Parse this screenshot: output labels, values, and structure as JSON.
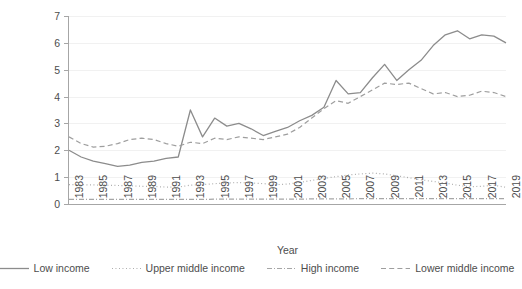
{
  "chart_data": {
    "type": "line",
    "title": "",
    "xlabel": "Year",
    "ylabel": "Remittances as share of GDP (%)",
    "xlim": [
      1983,
      2019
    ],
    "ylim": [
      0,
      7
    ],
    "ytick_labels": [
      "0",
      "1",
      "2",
      "3",
      "4",
      "5",
      "6",
      "7"
    ],
    "yticks": [
      0,
      1,
      2,
      3,
      4,
      5,
      6,
      7
    ],
    "grid": "horizontal",
    "legend_position": "bottom",
    "x": [
      1983,
      1984,
      1985,
      1986,
      1987,
      1988,
      1989,
      1990,
      1991,
      1992,
      1993,
      1994,
      1995,
      1996,
      1997,
      1998,
      1999,
      2000,
      2001,
      2002,
      2003,
      2004,
      2005,
      2006,
      2007,
      2008,
      2009,
      2010,
      2011,
      2012,
      2013,
      2014,
      2015,
      2016,
      2017,
      2018,
      2019
    ],
    "xtick_labels": [
      "1983",
      "1985",
      "1987",
      "1989",
      "1991",
      "1993",
      "1995",
      "1997",
      "1999",
      "2001",
      "2003",
      "2005",
      "2007",
      "2009",
      "2011",
      "2013",
      "2015",
      "2017",
      "2019"
    ],
    "series": [
      {
        "name": "Low income",
        "style": "solid",
        "color": "#8c8c8c",
        "values": [
          2.0,
          1.75,
          1.6,
          1.5,
          1.4,
          1.45,
          1.55,
          1.6,
          1.7,
          1.75,
          3.5,
          2.5,
          3.2,
          2.9,
          3.0,
          2.8,
          2.55,
          2.7,
          2.85,
          3.1,
          3.3,
          3.6,
          4.6,
          4.1,
          4.15,
          4.7,
          5.2,
          4.6,
          5.0,
          5.35,
          5.9,
          6.3,
          6.45,
          6.15,
          6.3,
          6.25,
          6.0
        ]
      },
      {
        "name": "Upper middle income",
        "style": "dotted",
        "color": "#a6a6a6",
        "values": [
          0.72,
          0.72,
          0.71,
          0.7,
          0.69,
          0.68,
          0.66,
          0.65,
          0.63,
          0.63,
          0.7,
          0.72,
          0.76,
          0.78,
          0.8,
          0.78,
          0.76,
          0.72,
          0.74,
          0.8,
          0.88,
          0.95,
          1.02,
          1.08,
          1.12,
          1.15,
          1.12,
          1.05,
          0.98,
          0.9,
          0.84,
          0.78,
          0.7,
          0.64,
          0.66,
          0.7,
          0.62
        ]
      },
      {
        "name": "High income",
        "style": "dashdot",
        "color": "#a6a6a6",
        "values": [
          0.17,
          0.17,
          0.17,
          0.17,
          0.17,
          0.17,
          0.17,
          0.17,
          0.17,
          0.17,
          0.17,
          0.17,
          0.18,
          0.18,
          0.18,
          0.18,
          0.18,
          0.18,
          0.18,
          0.18,
          0.19,
          0.19,
          0.19,
          0.19,
          0.2,
          0.2,
          0.2,
          0.2,
          0.2,
          0.2,
          0.2,
          0.2,
          0.2,
          0.2,
          0.2,
          0.2,
          0.2
        ]
      },
      {
        "name": "Lower middle income",
        "style": "dashed",
        "color": "#9e9e9e",
        "values": [
          2.5,
          2.25,
          2.12,
          2.15,
          2.25,
          2.4,
          2.45,
          2.4,
          2.25,
          2.15,
          2.3,
          2.25,
          2.45,
          2.4,
          2.5,
          2.45,
          2.4,
          2.5,
          2.6,
          2.85,
          3.2,
          3.55,
          3.85,
          3.75,
          4.0,
          4.25,
          4.5,
          4.45,
          4.5,
          4.3,
          4.1,
          4.15,
          4.0,
          4.05,
          4.2,
          4.15,
          4.0
        ]
      }
    ]
  },
  "axes": {
    "y_title": "Remittances as share of GDP (%)",
    "x_title": "Year"
  },
  "legend": {
    "items": [
      {
        "label": "Low income",
        "style": "solid"
      },
      {
        "label": "Upper middle income",
        "style": "dotted"
      },
      {
        "label": "High income",
        "style": "dashdot"
      },
      {
        "label": "Lower middle income",
        "style": "dashed"
      }
    ]
  },
  "colors": {
    "axis": "#a6a6a6",
    "grid": "#f1f1f1",
    "text": "#4d4d4d",
    "line": "#8c8c8c"
  }
}
